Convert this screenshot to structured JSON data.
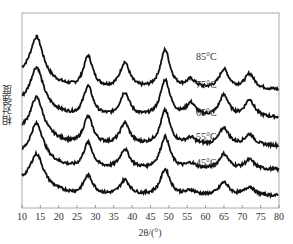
{
  "chart_data": {
    "type": "line",
    "title": "",
    "xlabel": "2θ/(°)",
    "ylabel": "相对强度",
    "xlim": [
      10,
      80
    ],
    "xticks": [
      10,
      15,
      20,
      25,
      30,
      35,
      40,
      45,
      50,
      55,
      60,
      65,
      70,
      75,
      80
    ],
    "grid": false,
    "legend": "inline labels near right side",
    "peaks_2theta": [
      14,
      28,
      38,
      49,
      56,
      65,
      72
    ],
    "series": [
      {
        "name": "85°C",
        "offset": 4,
        "label_x": 58,
        "peaks": [
          [
            14,
            1.0
          ],
          [
            28,
            0.75
          ],
          [
            38,
            0.6
          ],
          [
            49,
            0.9
          ],
          [
            56,
            0.2
          ],
          [
            65,
            0.45
          ],
          [
            72,
            0.35
          ]
        ]
      },
      {
        "name": "75°C",
        "offset": 3,
        "label_x": 58,
        "peaks": [
          [
            14,
            0.95
          ],
          [
            28,
            0.7
          ],
          [
            38,
            0.55
          ],
          [
            49,
            0.85
          ],
          [
            56,
            0.3
          ],
          [
            65,
            0.5
          ],
          [
            72,
            0.4
          ]
        ]
      },
      {
        "name": "65°C",
        "offset": 2,
        "label_x": 58,
        "peaks": [
          [
            14,
            0.9
          ],
          [
            28,
            0.65
          ],
          [
            38,
            0.5
          ],
          [
            49,
            0.8
          ],
          [
            56,
            0.15
          ],
          [
            65,
            0.4
          ],
          [
            72,
            0.25
          ]
        ]
      },
      {
        "name": "55°C",
        "offset": 1,
        "label_x": 58,
        "peaks": [
          [
            14,
            0.85
          ],
          [
            28,
            0.6
          ],
          [
            38,
            0.45
          ],
          [
            49,
            0.75
          ],
          [
            56,
            0.12
          ],
          [
            65,
            0.35
          ],
          [
            72,
            0.22
          ]
        ]
      },
      {
        "name": "45°C",
        "offset": 0,
        "label_x": 58,
        "peaks": [
          [
            14,
            0.75
          ],
          [
            28,
            0.45
          ],
          [
            38,
            0.35
          ],
          [
            49,
            0.6
          ],
          [
            56,
            0.1
          ],
          [
            65,
            0.3
          ],
          [
            72,
            0.2
          ]
        ]
      }
    ]
  },
  "axes": {
    "xlabel": "2θ/(°)",
    "ylabel": "相对强度"
  }
}
